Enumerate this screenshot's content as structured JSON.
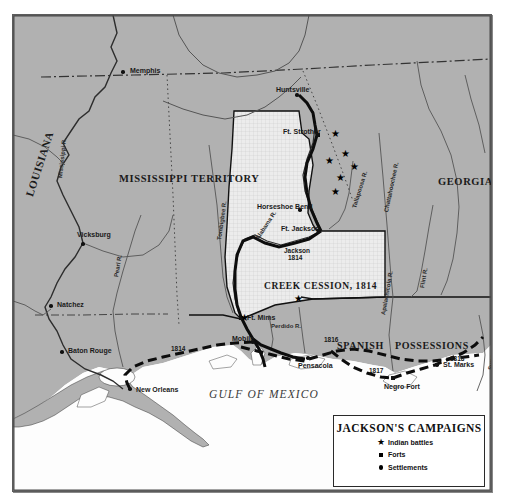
{
  "map": {
    "ocean_label": "GULF OF MEXICO",
    "regions": [
      {
        "name": "LOUISIANA",
        "x": 16,
        "y": 175,
        "size": 11,
        "rotate": -72
      },
      {
        "name": "MISSISSIPPI TERRITORY",
        "x": 106,
        "y": 158,
        "size": 10.5,
        "rotate": 0
      },
      {
        "name": "GEORGIA",
        "x": 425,
        "y": 161,
        "size": 10.5,
        "rotate": 0
      },
      {
        "name": "CREEK CESSION, 1814",
        "x": 251,
        "y": 266,
        "size": 9.5,
        "rotate": 0
      },
      {
        "name": "SPANISH",
        "x": 324,
        "y": 325,
        "size": 10,
        "rotate": 0
      },
      {
        "name": "POSSESSIONS",
        "x": 382,
        "y": 325,
        "size": 10,
        "rotate": 0
      }
    ],
    "settlements": [
      {
        "name": "Memphis",
        "x": 110,
        "y": 57,
        "lx": 117,
        "ly": 52
      },
      {
        "name": "Vicksburg",
        "x": 70,
        "y": 229,
        "lx": 64,
        "ly": 216
      },
      {
        "name": "Natchez",
        "x": 38,
        "y": 291,
        "lx": 44,
        "ly": 286
      },
      {
        "name": "Baton Rouge",
        "x": 49,
        "y": 337,
        "lx": 55,
        "ly": 332
      },
      {
        "name": "New Orleans",
        "x": 117,
        "y": 374,
        "lx": 123,
        "ly": 371
      },
      {
        "name": "Huntsville",
        "x": 284,
        "y": 80,
        "lx": 263,
        "ly": 71
      },
      {
        "name": "Horseshoe Bend",
        "x": 287,
        "y": 195,
        "lx": 244,
        "ly": 188
      },
      {
        "name": "Mobile",
        "x": 240,
        "y": 327,
        "lx": 219,
        "ly": 320
      },
      {
        "name": "Pensacola",
        "x": 295,
        "y": 343,
        "lx": 285,
        "ly": 347
      },
      {
        "name": "St. Marks",
        "x": 424,
        "y": 350,
        "lx": 430,
        "ly": 346
      }
    ],
    "forts": [
      {
        "name": "Ft. Strother",
        "x": 305,
        "y": 120,
        "lx": 270,
        "ly": 113
      },
      {
        "name": "Ft. Jackson",
        "x": 306,
        "y": 216,
        "lx": 268,
        "ly": 210
      },
      {
        "name": "Ft. Mims",
        "x": 228,
        "y": 303,
        "lx": 234,
        "ly": 299
      },
      {
        "name": "Negro Fort",
        "x": 380,
        "y": 363,
        "lx": 371,
        "ly": 368
      }
    ],
    "battles": [
      {
        "x": 322,
        "y": 119
      },
      {
        "x": 332,
        "y": 139
      },
      {
        "x": 341,
        "y": 152
      },
      {
        "x": 327,
        "y": 163
      },
      {
        "x": 316,
        "y": 146
      },
      {
        "x": 322,
        "y": 177
      },
      {
        "x": 285,
        "y": 284
      },
      {
        "x": 231,
        "y": 303
      }
    ],
    "rivers": [
      {
        "name": "Mississippi R.",
        "x": 47,
        "y": 160,
        "rotate": -84
      },
      {
        "name": "Pearl R.",
        "x": 103,
        "y": 259,
        "rotate": -80
      },
      {
        "name": "Tombigbee R.",
        "x": 206,
        "y": 222,
        "rotate": -82
      },
      {
        "name": "Alabama R.",
        "x": 244,
        "y": 221,
        "rotate": -57
      },
      {
        "name": "Tallapoosa R.",
        "x": 341,
        "y": 190,
        "rotate": -73
      },
      {
        "name": "Chattahoochee R.",
        "x": 373,
        "y": 194,
        "rotate": -78
      },
      {
        "name": "Flint R.",
        "x": 409,
        "y": 270,
        "rotate": -80
      },
      {
        "name": "Perdido R.",
        "x": 258,
        "y": 308,
        "rotate": 0
      },
      {
        "name": "Apalachicola R.",
        "x": 370,
        "y": 297,
        "rotate": -80
      },
      {
        "name": "Suwannee R.",
        "x": 477,
        "y": 352,
        "rotate": -80
      }
    ],
    "route_years": [
      {
        "year": "1814",
        "x": 158,
        "y": 330
      },
      {
        "year": "1814",
        "x": 275,
        "y": 239
      },
      {
        "year": "1816",
        "x": 311,
        "y": 321
      },
      {
        "year": "1817",
        "x": 356,
        "y": 352
      },
      {
        "year": "1818",
        "x": 437,
        "y": 340
      },
      {
        "year": "Jackson",
        "x": 271,
        "y": 232
      }
    ]
  },
  "legend": {
    "title": "JACKSON'S CAMPAIGNS",
    "items": [
      {
        "glyph": "star",
        "label": "Indian battles"
      },
      {
        "glyph": "square",
        "label": "Forts"
      },
      {
        "glyph": "circle",
        "label": "Settlements"
      }
    ]
  },
  "colors": {
    "land": "#b1b1b1",
    "water": "#fdfdfd",
    "cession": "#e8e8e8",
    "ink": "#111111",
    "frame": "#5c5c5c"
  }
}
